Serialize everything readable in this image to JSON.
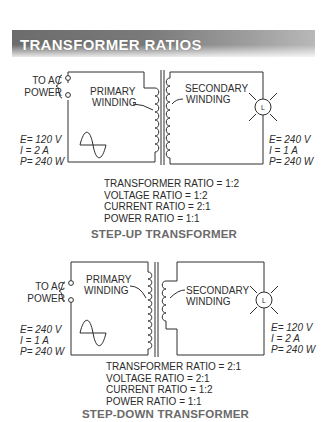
{
  "header": {
    "title": "TRANSFORMER RATIOS"
  },
  "step_up": {
    "caption": "STEP-UP TRANSFORMER",
    "source_label_line1": "TO AC",
    "source_label_line2": "POWER",
    "primary_label_line1": "PRIMARY",
    "primary_label_line2": "WINDING",
    "secondary_label_line1": "SECONDARY",
    "secondary_label_line2": "WINDING",
    "load_symbol": "L",
    "primary_values": {
      "E": "E= 120 V",
      "I": "I = 2 A",
      "P": "P= 240 W"
    },
    "secondary_values": {
      "E": "E= 240 V",
      "I": "I = 1 A",
      "P": "P= 240 W"
    },
    "ratios": {
      "transformer": "TRANSFORMER RATIO = 1:2",
      "voltage": "VOLTAGE RATIO = 1:2",
      "current": "CURRENT RATIO = 2:1",
      "power": "POWER RATIO = 1:1"
    }
  },
  "step_down": {
    "caption": "STEP-DOWN TRANSFORMER",
    "source_label_line1": "TO AC",
    "source_label_line2": "POWER",
    "primary_label_line1": "PRIMARY",
    "primary_label_line2": "WINDING",
    "secondary_label_line1": "SECONDARY",
    "secondary_label_line2": "WINDING",
    "load_symbol": "L",
    "primary_values": {
      "E": "E= 240 V",
      "I": "I = 1 A",
      "P": "P= 240 W"
    },
    "secondary_values": {
      "E": "E= 120 V",
      "I": "I = 2 A",
      "P": "P= 240 W"
    },
    "ratios": {
      "transformer": "TRANSFORMER RATIO = 2:1",
      "voltage": "VOLTAGE RATIO = 2:1",
      "current": "CURRENT RATIO = 1:2",
      "power": "POWER RATIO = 1:1"
    }
  },
  "colors": {
    "line": "#2e2e2e",
    "header_dark": "#6c6c6c",
    "caption": "#6a6a6a"
  }
}
